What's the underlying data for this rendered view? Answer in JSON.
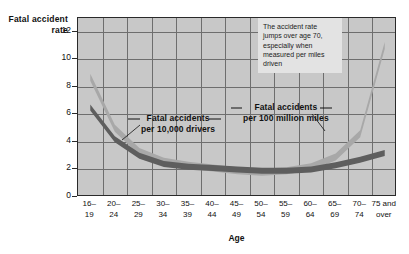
{
  "chart_data": {
    "type": "line",
    "title": "",
    "xlabel": "Age",
    "ylabel": "Fatal accident rate",
    "ylim": [
      0,
      13
    ],
    "yticks": [
      0,
      2,
      4,
      6,
      8,
      10,
      12
    ],
    "grid": true,
    "legend_position": "inline-annotations",
    "categories": [
      "16–19",
      "20–24",
      "25–29",
      "30–34",
      "35–39",
      "40–44",
      "45–49",
      "50–54",
      "55–59",
      "60–64",
      "65–69",
      "70–74",
      "75 and over"
    ],
    "category_lines": [
      [
        "16–",
        "19"
      ],
      [
        "20–",
        "24"
      ],
      [
        "25–",
        "29"
      ],
      [
        "30–",
        "34"
      ],
      [
        "35–",
        "39"
      ],
      [
        "40–",
        "44"
      ],
      [
        "45–",
        "49"
      ],
      [
        "50–",
        "54"
      ],
      [
        "55–",
        "59"
      ],
      [
        "60–",
        "64"
      ],
      [
        "65–",
        "69"
      ],
      [
        "70–",
        "74"
      ],
      [
        "75 and",
        "over"
      ]
    ],
    "series": [
      {
        "name": "Fatal accidents per 100 million miles",
        "color": "#a8a8a8",
        "values": [
          8.7,
          5.0,
          3.3,
          2.6,
          2.3,
          2.1,
          1.9,
          1.8,
          1.9,
          2.2,
          2.9,
          4.6,
          11.0
        ]
      },
      {
        "name": "Fatal accidents per 10,000 drivers",
        "color": "#5e5e5e",
        "values": [
          6.5,
          4.2,
          3.0,
          2.4,
          2.2,
          2.1,
          2.0,
          1.9,
          1.9,
          2.0,
          2.3,
          2.7,
          3.2
        ]
      }
    ],
    "annotations": [
      {
        "id": "callout-age-70",
        "text": "The accident rate jumps over age 70, especially when measured per miles driven"
      }
    ]
  },
  "axis": {
    "y_title_line1": "Fatal accident",
    "y_title_line2": "rate",
    "x_title": "Age"
  },
  "labels": {
    "drivers_line1": "Fatal accidents",
    "drivers_line2": "per 10,000 drivers",
    "miles_line1": "Fatal accidents",
    "miles_line2": "per 100 million miles"
  },
  "callout": {
    "line1": "The accident rate",
    "line2": "jumps over age",
    "line3": "70, especially when",
    "line4": "measured per miles",
    "line5": "driven"
  },
  "colors": {
    "plot_background": "#c8c8c8",
    "grid": "#6e6e6e",
    "frame": "#2a2a2a",
    "series_miles": "#a8a8a8",
    "series_drivers": "#5e5e5e",
    "callout_background": "#e3e3e3"
  }
}
